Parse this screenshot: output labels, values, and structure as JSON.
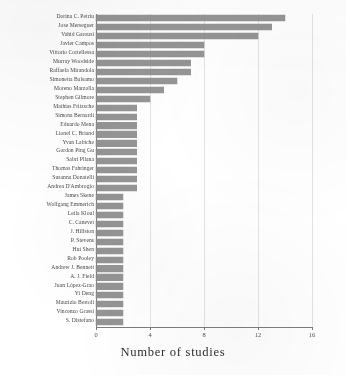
{
  "chart_data": {
    "type": "bar",
    "orientation": "horizontal",
    "title": "",
    "xlabel": "Number of studies",
    "ylabel": "",
    "xlim": [
      0,
      16
    ],
    "xticks": [
      0,
      4,
      8,
      12,
      16
    ],
    "grid": true,
    "legend": false,
    "bar_color": "#8d8d8d",
    "categories": [
      "Dorina C. Petriu",
      "Jose Merseguer",
      "Vahid Garousi",
      "Javier Campos",
      "Vittorio Cortellessa",
      "Murray Woodside",
      "Raffaela Mirandola",
      "Simonetta Balsamo",
      "Moreno Marzolla",
      "Stephen Gilmore",
      "Mathias Fritzsche",
      "Simona Bernardi",
      "Eduardo Mena",
      "Lionel C. Briand",
      "Yvan Labiche",
      "Gordon Ping Gu",
      "Sabri Pllana",
      "Thomas Fahringer",
      "Susanna Donatelli",
      "Andrea D'Ambrogio",
      "James Skene",
      "Wolfgang Emmerich",
      "Leila Kloul",
      "C. Canevet",
      "J. Hillston",
      "P. Stevens",
      "Hui Shen",
      "Rob Pooley",
      "Andrew J. Bennett",
      "A. J. Field",
      "Juan López-Grao",
      "Yi Deng",
      "Maurizio Bertoli",
      "Vincenzo Grassi",
      "S. Distefano"
    ],
    "values": [
      14,
      13,
      12,
      8,
      8,
      7,
      7,
      6,
      5,
      4,
      3,
      3,
      3,
      3,
      3,
      3,
      3,
      3,
      3,
      3,
      2,
      2,
      2,
      2,
      2,
      2,
      2,
      2,
      2,
      2,
      2,
      2,
      2,
      2,
      2
    ]
  },
  "axis": {
    "x_title": "Number of studies",
    "tick_labels": [
      "0",
      "4",
      "8",
      "12",
      "16"
    ]
  }
}
